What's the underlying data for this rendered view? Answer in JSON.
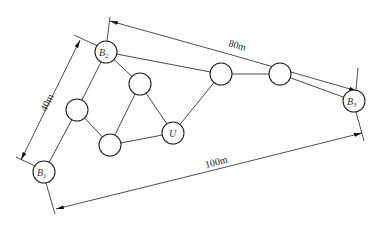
{
  "diagram": {
    "nodes": [
      {
        "id": "B2",
        "label": "B",
        "sub": "2",
        "x": 106,
        "y": 52
      },
      {
        "id": "B1",
        "label": "B",
        "sub": "1",
        "x": 44,
        "y": 172
      },
      {
        "id": "B3",
        "label": "B",
        "sub": "3",
        "x": 354,
        "y": 101
      },
      {
        "id": "U",
        "label": "U",
        "sub": "",
        "x": 173,
        "y": 133
      },
      {
        "id": "n1",
        "label": "",
        "sub": "",
        "x": 140,
        "y": 84
      },
      {
        "id": "n2",
        "label": "",
        "sub": "",
        "x": 77,
        "y": 110
      },
      {
        "id": "n3",
        "label": "",
        "sub": "",
        "x": 110,
        "y": 145
      },
      {
        "id": "n4",
        "label": "",
        "sub": "",
        "x": 221,
        "y": 74
      },
      {
        "id": "n5",
        "label": "",
        "sub": "",
        "x": 280,
        "y": 74
      }
    ],
    "edges": [
      [
        "B2",
        "n1"
      ],
      [
        "B2",
        "n2"
      ],
      [
        "B2",
        "B3"
      ],
      [
        "n2",
        "B1"
      ],
      [
        "n2",
        "n3"
      ],
      [
        "n1",
        "n3"
      ],
      [
        "n1",
        "U"
      ],
      [
        "n3",
        "U"
      ],
      [
        "U",
        "n4"
      ],
      [
        "n4",
        "n5"
      ],
      [
        "n5",
        "B3"
      ]
    ],
    "dimensions": {
      "b1_b2": "40m",
      "b2_b3": "80m",
      "b1_b3": "100m"
    }
  }
}
